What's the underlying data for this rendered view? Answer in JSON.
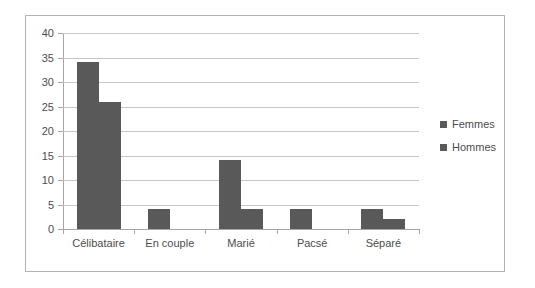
{
  "chart_data": {
    "type": "bar",
    "title": "",
    "subtitle": "",
    "xlabel": "",
    "ylabel": "",
    "categories": [
      "Célibataire",
      "En couple",
      "Marié",
      "Pacsé",
      "Séparé"
    ],
    "series": [
      {
        "name": "Femmes",
        "values": [
          34,
          4,
          14,
          4,
          4
        ],
        "color": "#595959"
      },
      {
        "name": "Hommes",
        "values": [
          26,
          0,
          4,
          0,
          2
        ],
        "color": "#595959"
      }
    ],
    "ylim": [
      0,
      40
    ],
    "yticks": [
      0,
      5,
      10,
      15,
      20,
      25,
      30,
      35,
      40
    ],
    "ytick_labels": [
      "0",
      "5",
      "10",
      "15",
      "20",
      "25",
      "30",
      "35",
      "40"
    ],
    "grid": true,
    "grid_axis": "y",
    "legend_position": "right",
    "legend_entries": [
      "Femmes",
      "Hommes"
    ],
    "bar_mode": "clustered",
    "annotations": []
  },
  "legend": {
    "items": [
      {
        "label": "Femmes",
        "marker": "square-marker"
      },
      {
        "label": "Hommes",
        "marker": "square-marker"
      }
    ]
  },
  "colors": {
    "bar": "#595959",
    "gridline": "#c6c6c6",
    "axis": "#a6a6a6",
    "text": "#4d4d4d",
    "frame_border": "#b3b3b3",
    "background": "#ffffff"
  }
}
